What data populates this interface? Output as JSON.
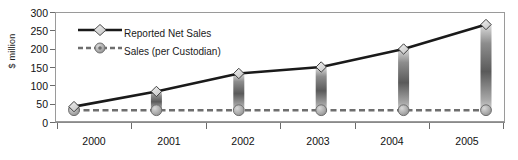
{
  "chart_data": {
    "type": "line",
    "title": "",
    "xlabel": "",
    "ylabel": "$ million",
    "categories": [
      "2000",
      "2001",
      "2002",
      "2003",
      "2004",
      "2005"
    ],
    "ylim": [
      0,
      300
    ],
    "yticks": [
      0,
      50,
      100,
      150,
      200,
      250,
      300
    ],
    "grid": false,
    "legend_position": "top-left inside plot",
    "series": [
      {
        "name": "Reported Net Sales",
        "marker": "diamond",
        "line_style": "solid",
        "color": "#1a1a1a",
        "marker_fill": "#e8e8e8",
        "values": [
          40,
          82,
          132,
          150,
          200,
          268
        ]
      },
      {
        "name": "Sales (per Custodian)",
        "marker": "circle",
        "line_style": "dashed",
        "color": "#6e6e6e",
        "marker_fill": "#b3b3b3",
        "values": [
          30,
          30,
          30,
          30,
          30,
          30
        ]
      }
    ],
    "dropbars": {
      "name": "gap bars",
      "description": "vertical gradient bars connecting Reported Net Sales to Sales (per Custodian)",
      "gradient_top": "#d9d9d9",
      "gradient_mid": "#5e5e5e",
      "gradient_bottom": "#cfcfcf"
    }
  },
  "axes": {
    "y_label": "$ million",
    "y_tick_labels": [
      "300",
      "250",
      "200",
      "150",
      "100",
      "50",
      "0"
    ],
    "x_tick_labels": [
      "2000",
      "2001",
      "2002",
      "2003",
      "2004",
      "2005"
    ]
  },
  "legend": {
    "items": [
      {
        "label": "Reported Net Sales"
      },
      {
        "label": "Sales (per Custodian)"
      }
    ]
  },
  "colors": {
    "plot_border": "#9a9a9a",
    "axis": "#6b6b6b",
    "series1": "#1a1a1a",
    "series2": "#6e6e6e",
    "background": "#ffffff"
  }
}
